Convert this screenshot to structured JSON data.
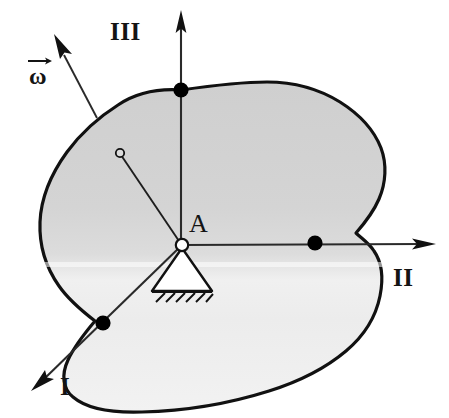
{
  "figure": {
    "type": "engineering-mechanics-diagram",
    "width": 449,
    "height": 418
  },
  "labels": {
    "axis_iii": "III",
    "axis_ii": "II",
    "axis_i": "I",
    "pivot_point": "A",
    "angular_velocity": "ω"
  },
  "colors": {
    "background": "#ffffff",
    "outline": "#111111",
    "body_fill_upper": "#d2d2d2",
    "body_fill_lower": "#ededed",
    "axis_line": "#2a2a2a",
    "marker_fill": "#000000",
    "support_fill": "#ffffff",
    "text": "#141414"
  },
  "geometry": {
    "pivot": {
      "x": 182,
      "y": 245
    },
    "center_of_mass_marker": {
      "x": 120,
      "y": 153
    },
    "axis_i": {
      "name": "axis-i",
      "from": {
        "x": 182,
        "y": 245
      },
      "to": {
        "x": 33,
        "y": 389
      },
      "arrow_at": "to",
      "boundary_marker": {
        "x": 103,
        "y": 323
      }
    },
    "axis_ii": {
      "name": "axis-ii",
      "from": {
        "x": 182,
        "y": 245
      },
      "to": {
        "x": 432,
        "y": 245
      },
      "arrow_at": "to",
      "boundary_marker": {
        "x": 315,
        "y": 243
      }
    },
    "axis_iii": {
      "name": "axis-iii",
      "from": {
        "x": 181,
        "y": 245
      },
      "to": {
        "x": 181,
        "y": 12
      },
      "arrow_at": "to",
      "boundary_marker": {
        "x": 181,
        "y": 90
      }
    },
    "omega_vector": {
      "name": "omega-vector",
      "from": {
        "x": 97,
        "y": 117
      },
      "to": {
        "x": 56,
        "y": 40
      },
      "arrow_at": "to"
    },
    "support": {
      "apex": {
        "x": 182,
        "y": 247
      },
      "base_left": {
        "x": 152,
        "y": 292
      },
      "base_right": {
        "x": 212,
        "y": 292
      },
      "hatch_count": 6
    },
    "body_outline_path": "M 181,90 C 150,89 132,96 118,106 C 100,118 82,133 68,152 C 52,173 42,198 41,222 C 40,247 47,268 59,285 C 68,298 82,311 95,321 C 84,333 74,347 68,360 C 62,374 63,388 72,396 C 85,408 110,412 140,412 C 185,412 230,404 268,392 C 300,382 326,368 345,352 C 364,336 375,317 379,297 C 383,277 381,262 374,252 C 368,243 360,238 355,233 C 362,226 372,214 378,200 C 385,184 386,165 380,149 C 373,131 358,115 339,103 C 318,90 292,83 266,83 C 237,83 209,86 181,90 Z"
  },
  "markers": [
    {
      "name": "marker-axis-iii-boundary",
      "x": 181,
      "y": 90,
      "r": 7.5,
      "style": "filled"
    },
    {
      "name": "marker-axis-ii-boundary",
      "x": 315,
      "y": 243,
      "r": 7.5,
      "style": "filled"
    },
    {
      "name": "marker-axis-i-boundary",
      "x": 103,
      "y": 323,
      "r": 7.5,
      "style": "filled"
    },
    {
      "name": "marker-pivot-a",
      "x": 182,
      "y": 245,
      "r": 6,
      "style": "open"
    },
    {
      "name": "marker-center-of-mass",
      "x": 120,
      "y": 153,
      "r": 4,
      "style": "open"
    }
  ]
}
